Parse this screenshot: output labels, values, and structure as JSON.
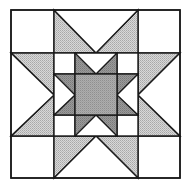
{
  "figure": {
    "block": {
      "x": 11,
      "y": 10,
      "size": 169,
      "grid_units": 4
    },
    "colors": {
      "background": "#ffffff",
      "outline": "#1a1a1a",
      "outer_star_points": "#c6c6c6",
      "inner_star_points": "#8e8e8e",
      "center_square": "#a2a2a2",
      "corner_squares": "#ffffff"
    },
    "pieces": {
      "outer_corners": 4,
      "outer_flying_geese": 4,
      "inner_corners": 4,
      "inner_flying_geese": 4,
      "center_square": 1
    }
  }
}
